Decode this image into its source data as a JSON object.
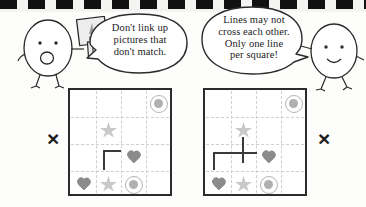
{
  "page": {
    "top_border": "checkered-strip"
  },
  "characters": [
    {
      "id": "left-egg",
      "name": "egg-character-with-sign",
      "expression": "surprised",
      "holds": "warning-sign",
      "sign_symbol": "!"
    },
    {
      "id": "right-egg",
      "name": "egg-character-smiling",
      "expression": "smiling",
      "holds": "none",
      "sign_symbol": ""
    }
  ],
  "bubbles": [
    {
      "id": "bubble-left",
      "speaker": "left-egg",
      "lines": [
        "Don't link up",
        "pictures that",
        "don't match."
      ]
    },
    {
      "id": "bubble-right",
      "speaker": "right-egg",
      "lines": [
        "Lines may not",
        "cross each other.",
        "Only one line",
        "per square!"
      ]
    }
  ],
  "marks": {
    "left_x": "×",
    "right_x": "×"
  },
  "grids": [
    {
      "id": "grid-left",
      "caption": "",
      "rows": 4,
      "cols": 4,
      "verdict": "incorrect",
      "symbols": [
        {
          "row": 1,
          "col": 4,
          "type": "ring"
        },
        {
          "row": 2,
          "col": 2,
          "type": "star"
        },
        {
          "row": 3,
          "col": 3,
          "type": "heart"
        },
        {
          "row": 4,
          "col": 1,
          "type": "heart"
        },
        {
          "row": 4,
          "col": 2,
          "type": "star"
        },
        {
          "row": 4,
          "col": 3,
          "type": "ring"
        }
      ],
      "drawn_line": "corner-L"
    },
    {
      "id": "grid-right",
      "caption": "",
      "rows": 4,
      "cols": 4,
      "verdict": "incorrect",
      "symbols": [
        {
          "row": 1,
          "col": 4,
          "type": "ring"
        },
        {
          "row": 2,
          "col": 2,
          "type": "star"
        },
        {
          "row": 3,
          "col": 3,
          "type": "heart"
        },
        {
          "row": 4,
          "col": 1,
          "type": "heart"
        },
        {
          "row": 4,
          "col": 2,
          "type": "star"
        },
        {
          "row": 4,
          "col": 3,
          "type": "ring"
        }
      ],
      "drawn_line": "crossing-plus"
    }
  ],
  "colors": {
    "ink": "#2b2b2b",
    "heart": "#8b8b8b",
    "star": "#c9c9c9",
    "ring": "#b4b4b4",
    "grid_line": "#cfcfcf",
    "drawn_line": "#3a3a3a",
    "strip_dark": "#111111",
    "strip_light": "#f4f4f2"
  }
}
